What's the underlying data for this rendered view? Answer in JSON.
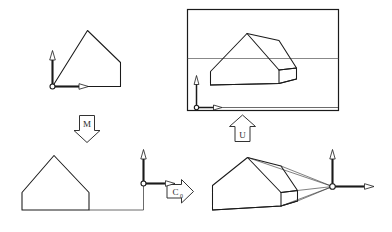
{
  "figure": {
    "title": "Viewing transformation pipeline diagram",
    "background_color": "#ffffff",
    "ink_color": "#1a1a1a",
    "width": 392,
    "height": 232
  },
  "panels": [
    {
      "id": "top-left",
      "name": "object-in-model-coordinates",
      "description": "2D house outline with coordinate axes at its lower-left corner",
      "has_axes": true,
      "axes_origin_label": "",
      "shape": "house-outline-2d"
    },
    {
      "id": "top-right",
      "name": "projected-image-in-viewport",
      "description": "3D house solid drawn inside a rectangular picture frame crossed by a horizon line, with coordinate axes at lower-left of the frame",
      "has_axes": true,
      "has_frame": true,
      "has_horizon": true,
      "shape": "house-solid-3d"
    },
    {
      "id": "bottom-left",
      "name": "object-after-modeling-transform",
      "description": "2D house outline connected by a thin line to coordinate axes placed to its right",
      "has_axes": true,
      "shape": "house-outline-2d"
    },
    {
      "id": "bottom-right",
      "name": "object-with-projection-rays",
      "description": "3D house solid with four projection rays converging on the axes origin (center of projection)",
      "has_axes": true,
      "has_projection_rays": true,
      "projection_ray_count": 4,
      "shape": "house-solid-3d"
    }
  ],
  "arrows": [
    {
      "id": "arrow-m",
      "name": "block-arrow-down-m",
      "direction": "down",
      "label": "M",
      "subscript": "",
      "from_panel": "top-left",
      "to_panel": "bottom-left"
    },
    {
      "id": "arrow-c0",
      "name": "block-arrow-right-c0",
      "direction": "right",
      "label": "C",
      "subscript": "0",
      "from_panel": "bottom-left",
      "to_panel": "bottom-right"
    },
    {
      "id": "arrow-u",
      "name": "block-arrow-up-u",
      "direction": "up",
      "label": "U",
      "subscript": "",
      "from_panel": "bottom-right",
      "to_panel": "top-right"
    }
  ],
  "axes": {
    "vertical_axis_name": "y-axis",
    "horizontal_axis_name": "x-axis",
    "origin_marker": "open-circle"
  }
}
